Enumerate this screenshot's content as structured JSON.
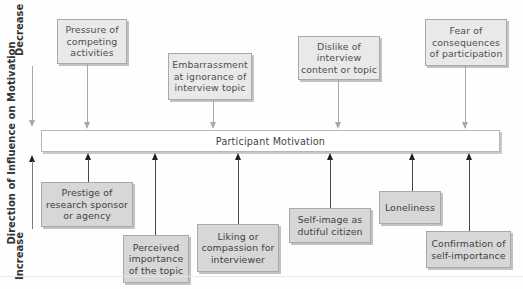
{
  "diagram": {
    "center_label": "Participant Motivation",
    "axis": {
      "title": "Direction of Influence on Motivation",
      "top_label": "Decrease",
      "bottom_label": "Increase"
    },
    "decreasing_factors": [
      {
        "label": "Pressure of\ncompeting\nactivities"
      },
      {
        "label": "Embarrassment\nat ignorance of\ninterview topic"
      },
      {
        "label": "Dislike of\ninterview\ncontent or topic"
      },
      {
        "label": "Fear of\nconsequences\nof participation"
      }
    ],
    "increasing_factors": [
      {
        "label": "Prestige of\nresearch sponsor\nor agency"
      },
      {
        "label": "Perceived\nimportance\nof the topic"
      },
      {
        "label": "Liking or\ncompassion for\ninterviewer"
      },
      {
        "label": "Self-image as\ndutiful citizen"
      },
      {
        "label": "Loneliness"
      },
      {
        "label": "Confirmation of\nself-importance"
      }
    ],
    "colors": {
      "decrease_box": "#e9e9e9",
      "increase_box": "#d7d7d7",
      "decrease_arrow": "#a9a9a9",
      "increase_arrow": "#1e1e1e",
      "box_border": "#a9a9a9"
    }
  }
}
